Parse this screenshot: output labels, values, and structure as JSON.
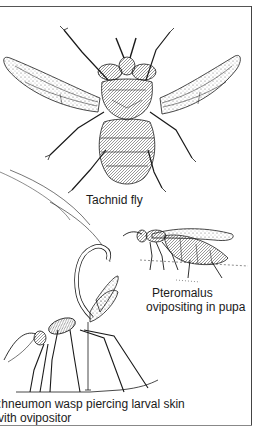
{
  "figure": {
    "illustrations": [
      {
        "id": "tachnid",
        "name": "Tachnid fly",
        "caption_lines": [
          "Tachnid fly"
        ]
      },
      {
        "id": "pteromalus",
        "name": "Pteromalus",
        "caption_lines": [
          "Pteromalus",
          "ovipositing in pupa"
        ]
      },
      {
        "id": "ichneumon",
        "name": "Ichneumon wasp",
        "caption_lines": [
          ":hneumon  wasp  piercing larval skin",
          "vith  ovipositor"
        ]
      }
    ],
    "colors": {
      "ink": "#1a1a1a",
      "paper": "#ffffff",
      "frame": "#555555"
    }
  }
}
